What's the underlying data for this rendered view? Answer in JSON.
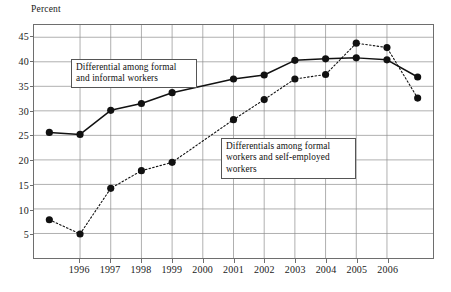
{
  "chart_data": {
    "type": "line",
    "title": "",
    "xlabel": "",
    "ylabel": "Percent",
    "ylim": [
      0,
      47.5
    ],
    "yticks": [
      5,
      10,
      15,
      20,
      25,
      30,
      35,
      40,
      45
    ],
    "xticks": [
      "1996",
      "1997",
      "1998",
      "1999",
      "2000",
      "2001",
      "2002",
      "2003",
      "2004",
      "2005",
      "2006"
    ],
    "x": [
      0,
      1,
      2,
      3,
      4,
      5,
      6,
      7,
      8,
      9,
      10,
      11,
      12
    ],
    "grid": true,
    "legend": "annotations-inline",
    "series": [
      {
        "name": "Differential among formal and informal workers",
        "style": "solid",
        "marker": "filled-circle",
        "color": "#111111",
        "values": [
          25.6,
          25.2,
          30.1,
          31.5,
          33.7,
          null,
          36.5,
          37.3,
          40.3,
          40.6,
          40.8,
          40.4,
          36.9
        ]
      },
      {
        "name": "Differentials among formal workers and self-employed workers",
        "style": "dotted",
        "marker": "filled-circle",
        "color": "#111111",
        "values": [
          7.8,
          4.9,
          14.2,
          17.8,
          19.5,
          null,
          28.2,
          32.3,
          36.5,
          37.4,
          43.8,
          42.9,
          32.6
        ]
      }
    ]
  },
  "annotations": {
    "formal_informal": "Differential among formal and informal workers",
    "self_employed": "Differentials among formal workers and self-employed workers"
  },
  "axis": {
    "y_title": "Percent",
    "y_labels": [
      "45",
      "40",
      "35",
      "30",
      "25",
      "20",
      "15",
      "10",
      "5"
    ],
    "x_labels": [
      "1996",
      "1997",
      "1998",
      "1999",
      "2000",
      "2001",
      "2002",
      "2003",
      "2004",
      "2005",
      "2006"
    ]
  }
}
